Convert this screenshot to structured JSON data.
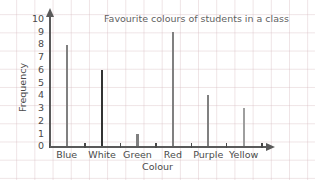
{
  "chart_data": {
    "type": "bar",
    "title": "Favourite colours of students in a class",
    "xlabel": "Colour",
    "ylabel": "Frequency",
    "categories": [
      "Blue",
      "White",
      "Green",
      "Red",
      "Purple",
      "Yellow"
    ],
    "values": [
      8,
      6,
      1,
      9,
      4,
      3
    ],
    "bar_colors": [
      "#808080",
      "#333333",
      "#808080",
      "#808080",
      "#808080",
      "#9e9e9e"
    ],
    "ylim": [
      0,
      10
    ],
    "yticks": [
      0,
      1,
      2,
      3,
      4,
      5,
      6,
      7,
      8,
      9,
      10
    ],
    "ytick_labels": [
      "0",
      "1",
      "2",
      "3",
      "4",
      "5",
      "6",
      "7",
      "8",
      "9",
      "10"
    ],
    "grid": true,
    "grid_style": "faint graph paper background",
    "legend": null,
    "axis_arrows": true,
    "axis_color": "#5a5a5a",
    "text_color": "#4a4a4a",
    "background": "#ffffff"
  }
}
